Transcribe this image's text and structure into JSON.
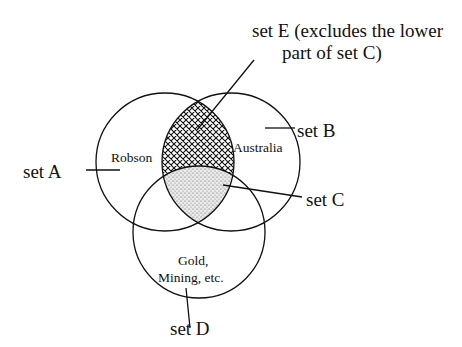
{
  "diagram": {
    "type": "venn",
    "sets": [
      {
        "id": "A",
        "label": "set A",
        "content": "Robson",
        "center": [
          165,
          162
        ],
        "r": 69
      },
      {
        "id": "B",
        "label": "set B",
        "content": "Australia",
        "center": [
          231,
          162
        ],
        "r": 69
      },
      {
        "id": "D",
        "label": "set D",
        "content_lines": [
          "Gold,",
          "Mining, etc."
        ],
        "center": [
          199,
          232
        ],
        "r": 66
      }
    ],
    "regions": [
      {
        "id": "E",
        "label_lines": [
          "set E (excludes the lower",
          "part of set C)"
        ],
        "definition": "A ∩ B minus D",
        "fill": "crosshatch"
      },
      {
        "id": "C",
        "label": "set C",
        "definition": "A ∩ B ∩ D",
        "fill": "stipple"
      }
    ]
  },
  "labels": {
    "setA": "set A",
    "setB": "set B",
    "setC": "set C",
    "setD": "set D",
    "setE_line1": "set E (excludes the lower",
    "setE_line2": "part of set C)",
    "robson": "Robson",
    "australia": "Australia",
    "gold_line1": "Gold,",
    "gold_line2": "Mining, etc."
  }
}
